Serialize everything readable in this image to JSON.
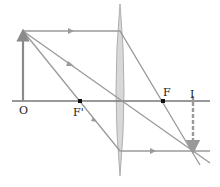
{
  "diagram": {
    "type": "converging-lens-ray-diagram",
    "colors": {
      "axis": "#777777",
      "ray": "#9a9a9a",
      "object": "#8a8a8a",
      "lens_fill": "#d8d8d8",
      "lens_stroke": "#b0b0b0",
      "image": "#999999",
      "point": "#111111",
      "text": "#222222"
    },
    "labels": {
      "origin": "O",
      "object_focal": "F'",
      "image_focal": "F",
      "image": "I"
    },
    "points": {
      "origin": {
        "x": 23,
        "y": 101
      },
      "object_tip": {
        "x": 23,
        "y": 31
      },
      "lens_center": {
        "x": 120,
        "y": 101
      },
      "object_focal": {
        "x": 80,
        "y": 101
      },
      "image_focal": {
        "x": 163,
        "y": 101
      },
      "image_base": {
        "x": 193,
        "y": 101
      },
      "image_tip": {
        "x": 193,
        "y": 151
      }
    }
  }
}
